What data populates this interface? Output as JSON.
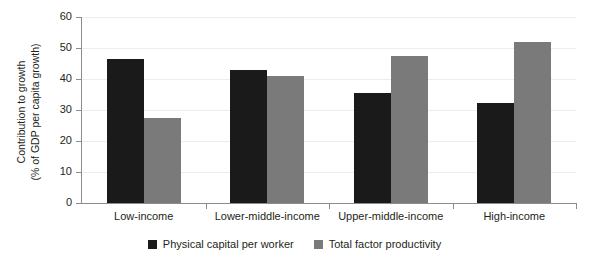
{
  "chart_data": {
    "type": "bar",
    "title": "",
    "xlabel": "",
    "ylabel": "Contribution to growth (% of GDP per capita growth)",
    "ylabel_line1": "Contribution to growth",
    "ylabel_line2": "(% of GDP per capita growth)",
    "categories": [
      "Low-income",
      "Lower-middle-income",
      "Upper-middle-income",
      "High-income"
    ],
    "series": [
      {
        "name": "Physical capital per worker",
        "color": "#1a1a1a",
        "values": [
          46.5,
          42.9,
          35.4,
          32.2
        ]
      },
      {
        "name": "Total factor productivity",
        "color": "#7a7a7a",
        "values": [
          27.4,
          40.9,
          47.3,
          51.8
        ]
      }
    ],
    "ylim": [
      0,
      60
    ],
    "ytick_values": [
      0,
      10,
      20,
      30,
      40,
      50,
      60
    ],
    "ytick_labels": [
      "0",
      "10",
      "20",
      "30",
      "40",
      "50",
      "60"
    ],
    "grid": true,
    "grid_axis": "y",
    "legend_position": "bottom-center",
    "axis_color": "#8c8c8c",
    "grid_color": "#ededed",
    "background": "#ffffff"
  }
}
